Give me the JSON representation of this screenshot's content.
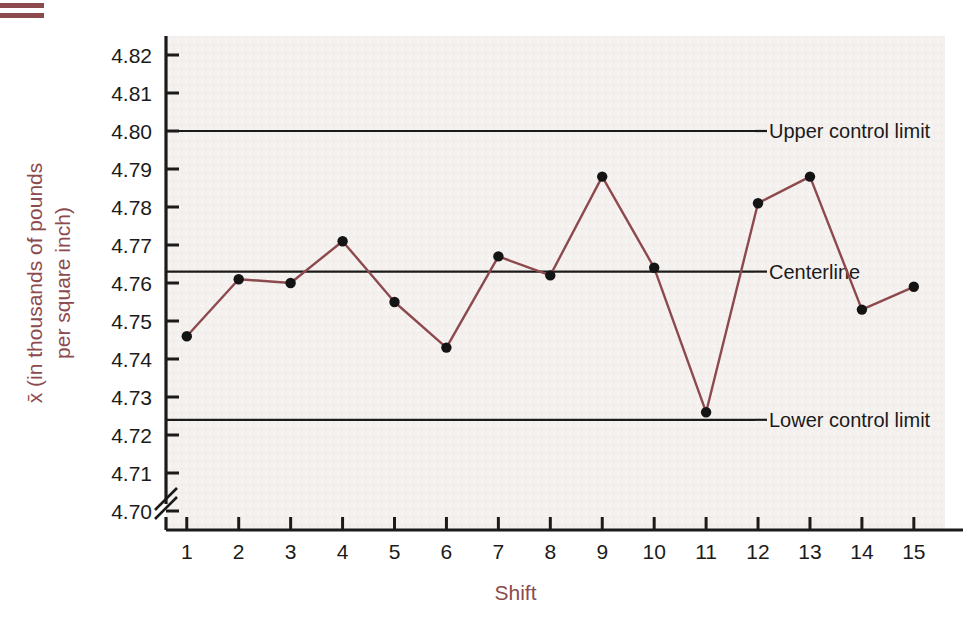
{
  "figure": {
    "decor_name": "double-rule-marker",
    "background_color": "#ffffff",
    "plot_background_color": "#f4f0ee",
    "accent_color": "#8d4a4e",
    "axis_color": "#1b1b1b",
    "series_color": "#8d4a4e",
    "marker_color": "#141414"
  },
  "chart_data": {
    "type": "line",
    "title": "",
    "xlabel": "Shift",
    "ylabel": "x̄ (in thousands of pounds per square inch)",
    "ylabel_line1": "x̄ (in thousands of pounds",
    "ylabel_line2": "per square inch)",
    "x": [
      1,
      2,
      3,
      4,
      5,
      6,
      7,
      8,
      9,
      10,
      11,
      12,
      13,
      14,
      15
    ],
    "categories": [
      "1",
      "2",
      "3",
      "4",
      "5",
      "6",
      "7",
      "8",
      "9",
      "10",
      "11",
      "12",
      "13",
      "14",
      "15"
    ],
    "values": [
      4.746,
      4.761,
      4.76,
      4.771,
      4.755,
      4.743,
      4.767,
      4.762,
      4.788,
      4.764,
      4.726,
      4.781,
      4.788,
      4.753,
      4.759
    ],
    "series": [
      {
        "name": "x-bar",
        "values": [
          4.746,
          4.761,
          4.76,
          4.771,
          4.755,
          4.743,
          4.767,
          4.762,
          4.788,
          4.764,
          4.726,
          4.781,
          4.788,
          4.753,
          4.759
        ]
      }
    ],
    "ylim": [
      4.695,
      4.825
    ],
    "yticks": [
      4.7,
      4.71,
      4.72,
      4.73,
      4.74,
      4.75,
      4.76,
      4.77,
      4.78,
      4.79,
      4.8,
      4.81,
      4.82
    ],
    "ytick_labels": [
      "4.70",
      "4.71",
      "4.72",
      "4.73",
      "4.74",
      "4.75",
      "4.76",
      "4.77",
      "4.78",
      "4.79",
      "4.80",
      "4.81",
      "4.82"
    ],
    "xlim": [
      0.6,
      15.6
    ],
    "xticks": [
      1,
      2,
      3,
      4,
      5,
      6,
      7,
      8,
      9,
      10,
      11,
      12,
      13,
      14,
      15
    ],
    "grid": false,
    "legend_position": "right-inline-annotations",
    "axis_break": true,
    "reference_lines": [
      {
        "id": "ucl",
        "label": "Upper control limit",
        "value": 4.8
      },
      {
        "id": "centerline",
        "label": "Centerline",
        "value": 4.763
      },
      {
        "id": "lcl",
        "label": "Lower control limit",
        "value": 4.724
      }
    ],
    "annotations": [
      {
        "label": "Upper control limit",
        "y": 4.8
      },
      {
        "label": "Centerline",
        "y": 4.763
      },
      {
        "label": "Lower control limit",
        "y": 4.724
      }
    ]
  }
}
